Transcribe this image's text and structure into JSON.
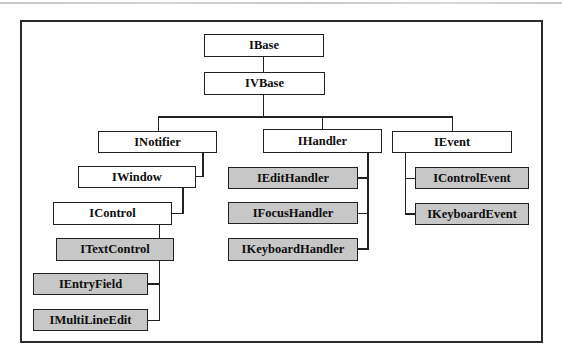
{
  "diagram": {
    "colors": {
      "shaded_fill": "#c7c7c7",
      "unshaded_fill": "#ffffff",
      "line": "#222222",
      "page_rule": "#b9b9b9"
    },
    "nodes": {
      "ibase": {
        "label": "IBase",
        "shaded": false
      },
      "ivbase": {
        "label": "IVBase",
        "shaded": false
      },
      "inotifier": {
        "label": "INotifier",
        "shaded": false
      },
      "ihandler": {
        "label": "IHandler",
        "shaded": false
      },
      "ievent": {
        "label": "IEvent",
        "shaded": false
      },
      "iwindow": {
        "label": "IWindow",
        "shaded": false
      },
      "icontrol": {
        "label": "IControl",
        "shaded": false
      },
      "itextcontrol": {
        "label": "ITextControl",
        "shaded": true
      },
      "ientryfield": {
        "label": "IEntryField",
        "shaded": true
      },
      "imultilineedit": {
        "label": "IMultiLineEdit",
        "shaded": true
      },
      "iedithandler": {
        "label": "IEditHandler",
        "shaded": true
      },
      "ifocushandler": {
        "label": "IFocusHandler",
        "shaded": true
      },
      "ikeyboardhandler": {
        "label": "IKeyboardHandler",
        "shaded": true
      },
      "icontrolevent": {
        "label": "IControlEvent",
        "shaded": true
      },
      "ikeyboardevent": {
        "label": "IKeyboardEvent",
        "shaded": true
      }
    },
    "edges": [
      {
        "from": "IBase",
        "to": "IVBase"
      },
      {
        "from": "IVBase",
        "to": "INotifier"
      },
      {
        "from": "IVBase",
        "to": "IHandler"
      },
      {
        "from": "IVBase",
        "to": "IEvent"
      },
      {
        "from": "INotifier",
        "to": "IWindow"
      },
      {
        "from": "IWindow",
        "to": "IControl"
      },
      {
        "from": "IControl",
        "to": "ITextControl"
      },
      {
        "from": "ITextControl",
        "to": "IEntryField"
      },
      {
        "from": "ITextControl",
        "to": "IMultiLineEdit"
      },
      {
        "from": "IHandler",
        "to": "IEditHandler"
      },
      {
        "from": "IHandler",
        "to": "IFocusHandler"
      },
      {
        "from": "IHandler",
        "to": "IKeyboardHandler"
      },
      {
        "from": "IEvent",
        "to": "IControlEvent"
      },
      {
        "from": "IEvent",
        "to": "IKeyboardEvent"
      }
    ]
  }
}
